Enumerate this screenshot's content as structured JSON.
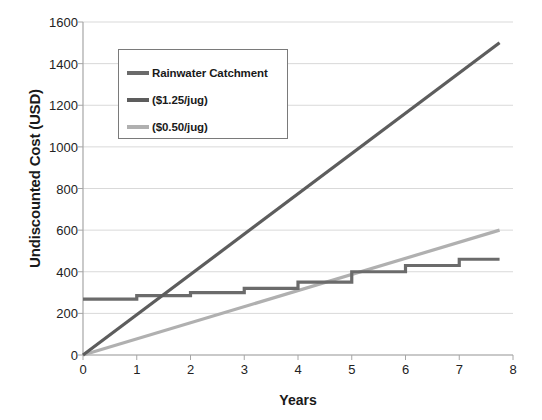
{
  "chart_data": {
    "type": "line",
    "title": "",
    "xlabel": "Years",
    "ylabel": "Undiscounted Cost (USD)",
    "xlim": [
      0,
      8
    ],
    "ylim": [
      0,
      1600
    ],
    "xticks": [
      0,
      1,
      2,
      3,
      4,
      5,
      6,
      7,
      8
    ],
    "yticks": [
      0,
      200,
      400,
      600,
      800,
      1000,
      1200,
      1400,
      1600
    ],
    "grid": "horizontal",
    "legend_position": "upper-left-inside",
    "series": [
      {
        "name": "Rainwater Catchment",
        "color": "#6b6b6b",
        "style": "step",
        "x": [
          0,
          1,
          1,
          2,
          2,
          3,
          3,
          4,
          4,
          5,
          5,
          6,
          6,
          7,
          7,
          7.75
        ],
        "y": [
          268,
          268,
          285,
          285,
          300,
          300,
          320,
          320,
          350,
          350,
          400,
          400,
          430,
          430,
          460,
          460
        ]
      },
      {
        "name": "($1.25/jug)",
        "color": "#5d5d5d",
        "style": "line",
        "x": [
          0,
          7.75
        ],
        "y": [
          0,
          1500
        ]
      },
      {
        "name": "($0.50/jug)",
        "color": "#b0b0b0",
        "style": "line",
        "x": [
          0,
          7.75
        ],
        "y": [
          0,
          600
        ]
      }
    ]
  },
  "axis": {
    "y_title": "Undiscounted Cost (USD)",
    "x_title": "Years",
    "y_tick_labels": [
      "1600",
      "1400",
      "1200",
      "1000",
      "800",
      "600",
      "400",
      "200",
      "0"
    ],
    "x_tick_labels": [
      "0",
      "1",
      "2",
      "3",
      "4",
      "5",
      "6",
      "7",
      "8"
    ]
  },
  "legend": {
    "items": [
      {
        "label": "Rainwater Catchment",
        "color": "#6b6b6b"
      },
      {
        "label": "($1.25/jug)",
        "color": "#5d5d5d"
      },
      {
        "label": "($0.50/jug)",
        "color": "#b0b0b0"
      }
    ]
  },
  "colors": {
    "grid": "#d9d9d9",
    "axis": "#a6a6a6",
    "text": "#1a1a1a",
    "background": "#ffffff"
  }
}
